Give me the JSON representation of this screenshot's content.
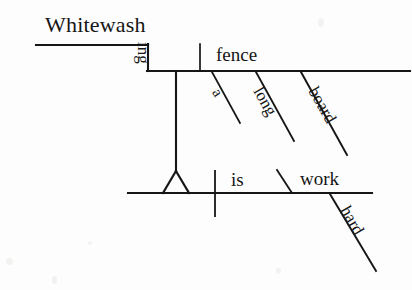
{
  "diagram": {
    "type": "reed-kellogg-sentence-diagram",
    "sentence": "Whitewashing a long board fence is hard work.",
    "ink_color": "#161616",
    "background_color": "#fdfdfd",
    "words": {
      "gerund_stem": "Whitewash",
      "gerund_suffix": "ing",
      "gerund_object": "fence",
      "object_modifier_article": "a",
      "object_modifier_adjective": "long",
      "object_modifier_noun": "board",
      "verb": "is",
      "predicate_noun": "work",
      "predicate_modifier": "hard"
    },
    "lines": {
      "gerund_upper_baseline": {
        "x1": 36,
        "y1": 45,
        "x2": 148,
        "y2": 45
      },
      "gerund_step_vertical": {
        "x1": 148,
        "y1": 45,
        "x2": 148,
        "y2": 71
      },
      "gerund_lower_baseline": {
        "x1": 148,
        "y1": 71,
        "x2": 410,
        "y2": 71
      },
      "object_divider": {
        "x1": 200,
        "y1": 44,
        "x2": 200,
        "y2": 71
      },
      "modifier_a": {
        "x1": 212,
        "y1": 72,
        "x2": 240,
        "y2": 123
      },
      "modifier_long": {
        "x1": 256,
        "y1": 72,
        "x2": 294,
        "y2": 141
      },
      "modifier_board": {
        "x1": 301,
        "y1": 72,
        "x2": 347,
        "y2": 155
      },
      "gerund_stand_stem": {
        "x1": 176,
        "y1": 71,
        "x2": 176,
        "y2": 172
      },
      "stand_triangle_left": {
        "x1": 176,
        "y1": 172,
        "x2": 163,
        "y2": 193
      },
      "stand_triangle_right": {
        "x1": 176,
        "y1": 172,
        "x2": 189,
        "y2": 193
      },
      "main_baseline": {
        "x1": 128,
        "y1": 193,
        "x2": 372,
        "y2": 193
      },
      "subject_verb_divider": {
        "x1": 215,
        "y1": 171,
        "x2": 215,
        "y2": 216
      },
      "predicate_slant": {
        "x1": 277,
        "y1": 170,
        "x2": 292,
        "y2": 193
      },
      "modifier_hard": {
        "x1": 330,
        "y1": 194,
        "x2": 376,
        "y2": 271
      }
    }
  }
}
